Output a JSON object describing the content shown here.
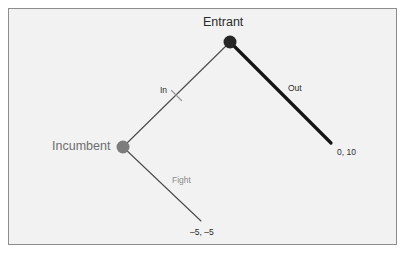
{
  "diagram": {
    "type": "extensive-form-game-tree",
    "title": "",
    "background_color": "#f2f2f2",
    "border_color": "#8d8d8d",
    "nodes": [
      {
        "id": "entrant",
        "label": "Entrant",
        "x": 230,
        "y": 42,
        "radius": 6.5,
        "color": "#262626",
        "label_color": "#2b2b2b"
      },
      {
        "id": "incumbent",
        "label": "Incumbent",
        "x": 123,
        "y": 147,
        "radius": 6.5,
        "color": "#7d7d7d",
        "label_color": "#6e6e6e"
      }
    ],
    "branches": [
      {
        "id": "in",
        "label": "In",
        "from": "entrant",
        "to": "incumbent",
        "x1": 230,
        "y1": 42,
        "x2": 123,
        "y2": 147,
        "width": 1.1,
        "color": "#4a4a4a",
        "bold": false,
        "pruned": true,
        "label_color": "#2b2b2b"
      },
      {
        "id": "out",
        "label": "Out",
        "from": "entrant",
        "to": "payoff-out",
        "x1": 230,
        "y1": 42,
        "x2": 331,
        "y2": 143,
        "width": 3.2,
        "color": "#151515",
        "bold": true,
        "pruned": false,
        "label_color": "#2b2b2b"
      },
      {
        "id": "fight",
        "label": "Fight",
        "from": "incumbent",
        "to": "payoff-fight",
        "x1": 123,
        "y1": 147,
        "x2": 201,
        "y2": 221,
        "width": 1.1,
        "color": "#4a4a4a",
        "bold": false,
        "pruned": false,
        "label_color": "#8a8a8a"
      }
    ],
    "payoffs": [
      {
        "id": "payoff-out",
        "text": "0, 10",
        "x": 337,
        "y": 148
      },
      {
        "id": "payoff-fight",
        "text": "–5, –5",
        "x": 190,
        "y": 228
      }
    ],
    "pruning_mark": {
      "branch": "in",
      "x": 176,
      "y": 95,
      "length": 11,
      "color": "#9a9a9a"
    }
  }
}
